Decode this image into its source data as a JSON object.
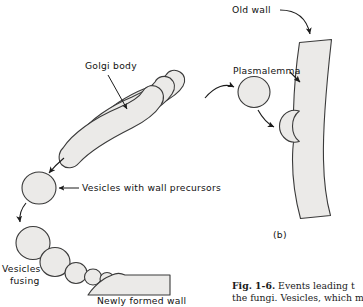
{
  "figure": {
    "panel_label": "(b)",
    "labels": {
      "golgi": "Golgi body",
      "vesicles_precursors": "Vesicles with wall precursors",
      "vesicles_fusing_line1": "Vesicles",
      "vesicles_fusing_line2": "fusing",
      "newly_formed_wall": "Newly formed wall",
      "old_wall": "Old wall",
      "plasmalemma": "Plasmalemma"
    },
    "caption": {
      "fig_number": "Fig. 1-6.",
      "line1_rest": "Events leading t",
      "line2": "the fungi. Vesicles, which m"
    },
    "colors": {
      "fill": "#ebeae8",
      "outline": "#3a3a3a",
      "text": "#111111",
      "background": "#ffffff"
    }
  }
}
